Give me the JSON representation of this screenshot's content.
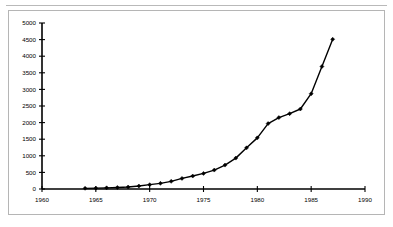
{
  "page": {
    "background_color": "#ffffff",
    "border_color": "#b5b5b5",
    "rule_color": "#b9b9b9"
  },
  "chart_data": {
    "type": "line",
    "title": "",
    "subtitle": "",
    "xlabel": "",
    "ylabel": "",
    "xlim": [
      1960,
      1990
    ],
    "ylim": [
      0,
      5000
    ],
    "grid": false,
    "legend": false,
    "legend_position": "none",
    "line_color": "#000000",
    "marker": "diamond",
    "x_tick_labels": [
      "1960",
      "1965",
      "1970",
      "1975",
      "1980",
      "1985",
      "1990"
    ],
    "x_ticks": [
      1960,
      1965,
      1970,
      1975,
      1980,
      1985,
      1990
    ],
    "y_tick_labels": [
      "0",
      "500",
      "1000",
      "1500",
      "2000",
      "2500",
      "3000",
      "3500",
      "4000",
      "4500",
      "5000"
    ],
    "y_ticks": [
      0,
      500,
      1000,
      1500,
      2000,
      2500,
      3000,
      3500,
      4000,
      4500,
      5000
    ],
    "series": [
      {
        "name": "series-1",
        "x": [
          1964,
          1965,
          1966,
          1967,
          1968,
          1969,
          1970,
          1971,
          1972,
          1973,
          1974,
          1975,
          1976,
          1977,
          1978,
          1979,
          1980,
          1981,
          1982,
          1983,
          1984,
          1985,
          1986,
          1987
        ],
        "values": [
          20,
          25,
          35,
          45,
          60,
          90,
          130,
          170,
          230,
          320,
          390,
          470,
          570,
          720,
          930,
          1240,
          1540,
          1970,
          2150,
          2270,
          2410,
          2870,
          3690,
          4510
        ]
      }
    ]
  }
}
